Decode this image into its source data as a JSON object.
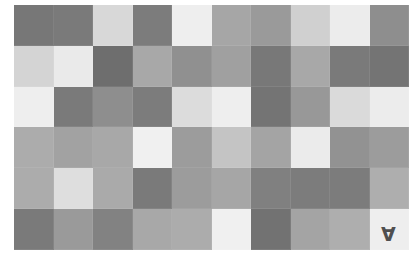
{
  "board": {
    "rows": 6,
    "cols": 10,
    "tiles": [
      [
        {
          "color": "#777777",
          "label": ""
        },
        {
          "color": "#7a7a7a",
          "label": ""
        },
        {
          "color": "#d8d8d8",
          "label": ""
        },
        {
          "color": "#7c7c7c",
          "label": ""
        },
        {
          "color": "#eeeeee",
          "label": ""
        },
        {
          "color": "#a6a6a6",
          "label": ""
        },
        {
          "color": "#9a9a9a",
          "label": ""
        },
        {
          "color": "#d0d0d0",
          "label": ""
        },
        {
          "color": "#ececec",
          "label": ""
        },
        {
          "color": "#8e8e8e",
          "label": ""
        }
      ],
      [
        {
          "color": "#d4d4d4",
          "label": ""
        },
        {
          "color": "#eaeaea",
          "label": ""
        },
        {
          "color": "#6e6e6e",
          "label": ""
        },
        {
          "color": "#a8a8a8",
          "label": ""
        },
        {
          "color": "#909090",
          "label": ""
        },
        {
          "color": "#a0a0a0",
          "label": ""
        },
        {
          "color": "#787878",
          "label": ""
        },
        {
          "color": "#a8a8a8",
          "label": ""
        },
        {
          "color": "#7a7a7a",
          "label": ""
        },
        {
          "color": "#747474",
          "label": ""
        }
      ],
      [
        {
          "color": "#eeeeee",
          "label": ""
        },
        {
          "color": "#7a7a7a",
          "label": ""
        },
        {
          "color": "#8e8e8e",
          "label": ""
        },
        {
          "color": "#7c7c7c",
          "label": ""
        },
        {
          "color": "#dcdcdc",
          "label": ""
        },
        {
          "color": "#eeeeee",
          "label": ""
        },
        {
          "color": "#747474",
          "label": ""
        },
        {
          "color": "#989898",
          "label": ""
        },
        {
          "color": "#dadada",
          "label": ""
        },
        {
          "color": "#ececec",
          "label": ""
        }
      ],
      [
        {
          "color": "#acacac",
          "label": ""
        },
        {
          "color": "#a2a2a2",
          "label": ""
        },
        {
          "color": "#a8a8a8",
          "label": ""
        },
        {
          "color": "#f0f0f0",
          "label": ""
        },
        {
          "color": "#9c9c9c",
          "label": ""
        },
        {
          "color": "#c4c4c4",
          "label": ""
        },
        {
          "color": "#a4a4a4",
          "label": ""
        },
        {
          "color": "#ebebeb",
          "label": ""
        },
        {
          "color": "#929292",
          "label": ""
        },
        {
          "color": "#9c9c9c",
          "label": ""
        }
      ],
      [
        {
          "color": "#acacac",
          "label": ""
        },
        {
          "color": "#dedede",
          "label": ""
        },
        {
          "color": "#aaaaaa",
          "label": ""
        },
        {
          "color": "#7a7a7a",
          "label": ""
        },
        {
          "color": "#9c9c9c",
          "label": ""
        },
        {
          "color": "#a6a6a6",
          "label": ""
        },
        {
          "color": "#808080",
          "label": ""
        },
        {
          "color": "#7c7c7c",
          "label": ""
        },
        {
          "color": "#7c7c7c",
          "label": ""
        },
        {
          "color": "#aeaeae",
          "label": ""
        }
      ],
      [
        {
          "color": "#7a7a7a",
          "label": ""
        },
        {
          "color": "#9a9a9a",
          "label": ""
        },
        {
          "color": "#828282",
          "label": ""
        },
        {
          "color": "#a8a8a8",
          "label": ""
        },
        {
          "color": "#acacac",
          "label": ""
        },
        {
          "color": "#f0f0f0",
          "label": ""
        },
        {
          "color": "#727272",
          "label": ""
        },
        {
          "color": "#a4a4a4",
          "label": ""
        },
        {
          "color": "#aeaeae",
          "label": ""
        },
        {
          "color": "#eeeeee",
          "label": "A",
          "rotated": true
        }
      ]
    ]
  }
}
